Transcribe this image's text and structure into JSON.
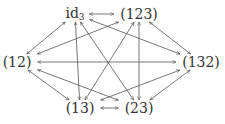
{
  "diagram": {
    "type": "complete-graph",
    "edge_style": "double-headed-arrow",
    "line_color": "#555555",
    "nodes": [
      {
        "id": "id3",
        "label": "id",
        "sub": "3",
        "x": 75,
        "y": 14
      },
      {
        "id": "c123",
        "label": "(123)",
        "sub": "",
        "x": 139,
        "y": 14
      },
      {
        "id": "c12",
        "label": "(12)",
        "sub": "",
        "x": 17,
        "y": 62
      },
      {
        "id": "c132",
        "label": "(132)",
        "sub": "",
        "x": 201,
        "y": 62
      },
      {
        "id": "c13",
        "label": "(13)",
        "sub": "",
        "x": 80,
        "y": 108
      },
      {
        "id": "c23",
        "label": "(23)",
        "sub": "",
        "x": 139,
        "y": 108
      }
    ],
    "edges": [
      [
        "id3",
        "c123"
      ],
      [
        "id3",
        "c12"
      ],
      [
        "id3",
        "c13"
      ],
      [
        "id3",
        "c23"
      ],
      [
        "id3",
        "c132"
      ],
      [
        "c123",
        "c12"
      ],
      [
        "c123",
        "c132"
      ],
      [
        "c123",
        "c13"
      ],
      [
        "c123",
        "c23"
      ],
      [
        "c12",
        "c132"
      ],
      [
        "c12",
        "c13"
      ],
      [
        "c12",
        "c23"
      ],
      [
        "c132",
        "c13"
      ],
      [
        "c132",
        "c23"
      ],
      [
        "c13",
        "c23"
      ]
    ]
  }
}
